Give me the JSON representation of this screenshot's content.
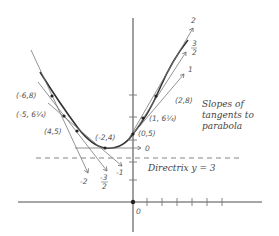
{
  "figure": {
    "title": "Slopes of tangents to parabola",
    "annotation_lines": [
      "Slopes of",
      "tangents to",
      "parabola"
    ],
    "directrix_label": "Directrix  y = 3",
    "origin_label": "0",
    "points": [
      {
        "label": "(-6,8)"
      },
      {
        "label": "(-5, 6¼)"
      },
      {
        "label": "(4,5)"
      },
      {
        "label": "(-2,4)"
      },
      {
        "label": "(0,5)"
      },
      {
        "label": "(1, 6¼)"
      },
      {
        "label": "(2,8)"
      }
    ],
    "slope_labels": {
      "right_top": "2",
      "right_mid_num": "3",
      "right_mid_den": "2",
      "right_low": "1",
      "horizontal": "0",
      "left_a": "-2",
      "left_b_num": "-3",
      "left_b_den": "2",
      "left_c": "-1"
    },
    "colors": {
      "curve": "#333333",
      "tangent": "#777777",
      "axis": "#888888"
    }
  }
}
